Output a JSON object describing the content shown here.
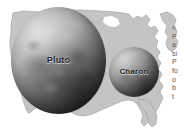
{
  "figure": {
    "type": "scale-comparison-illustration",
    "background_color": "#ffffff",
    "map": {
      "name": "united-states-outline",
      "fill_color": "#c4c4c4",
      "stroke_color": "#9a9a9a",
      "description": "Contiguous United States silhouette used as a size reference"
    },
    "bodies": [
      {
        "id": "pluto",
        "label": "Pluto",
        "shape": "sphere",
        "surface": "mottled gray, cratered",
        "light_direction": "upper-left",
        "base_color": "#8f8f8f",
        "highlight_color": "#c9c9c9",
        "shadow_color": "#2b2b2b",
        "relative_size": "larger"
      },
      {
        "id": "charon",
        "label": "Charon",
        "shape": "sphere",
        "surface": "smooth gray",
        "light_direction": "upper-left",
        "base_color": "#8a8a8a",
        "highlight_color": "#bdbdbd",
        "shadow_color": "#303030",
        "relative_size": "smaller"
      }
    ]
  },
  "caption": {
    "truncated": true,
    "note": "Caption text column clipped at right edge of image; only leading glyphs visible",
    "lines": [
      "<",
      "P",
      "a",
      "si",
      "P",
      "fo",
      "o",
      "b",
      "t"
    ]
  }
}
